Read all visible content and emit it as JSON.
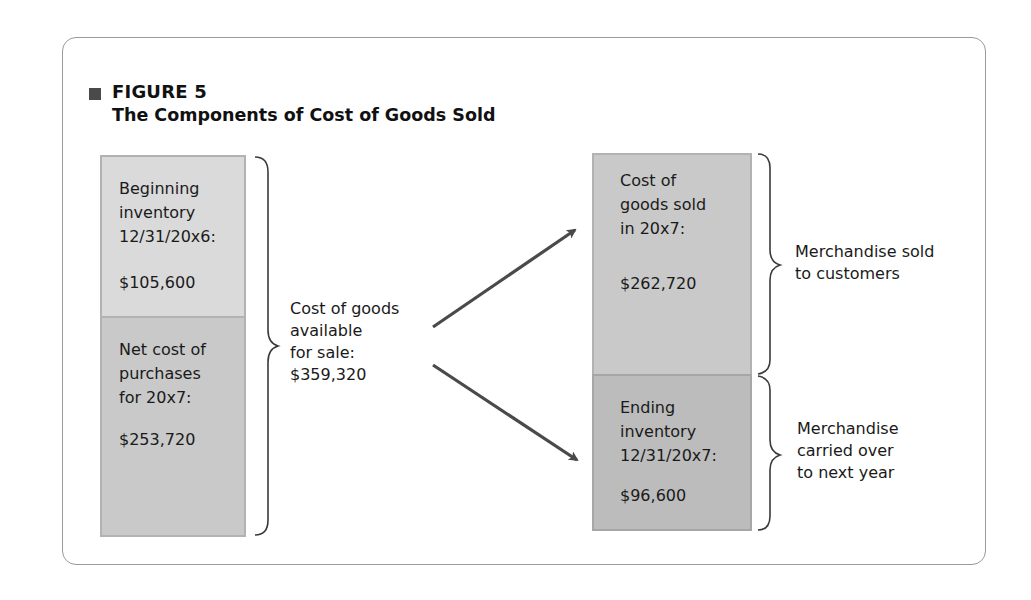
{
  "figure": {
    "label": "FIGURE 5",
    "title": "The Components of Cost of Goods Sold"
  },
  "left_stack": [
    {
      "lines": [
        "Beginning",
        "inventory",
        "12/31/20x6:"
      ],
      "amount": "$105,600"
    },
    {
      "lines": [
        "Net cost of",
        "purchases",
        "for 20x7:"
      ],
      "amount": "$253,720"
    }
  ],
  "middle_label": {
    "lines": [
      "Cost of goods",
      "available",
      "for sale:",
      "$359,320"
    ]
  },
  "right_stack": [
    {
      "lines": [
        "Cost of",
        "goods sold",
        "in 20x7:"
      ],
      "amount": "$262,720"
    },
    {
      "lines": [
        "Ending",
        "inventory",
        "12/31/20x7:"
      ],
      "amount": "$96,600"
    }
  ],
  "right_labels": [
    {
      "lines": [
        "Merchandise sold",
        "to customers"
      ]
    },
    {
      "lines": [
        "Merchandise",
        "carried over",
        "to next year"
      ]
    }
  ],
  "colors": {
    "beginning_inventory_fill": "#dadada",
    "purchases_fill": "#c9c9c9",
    "cogs_fill": "#c9c9c9",
    "ending_inventory_fill": "#bcbcbc",
    "arrow": "#4a4a4a",
    "bracket": "#3a3a3a",
    "panel_border": "#9a9a9a"
  }
}
